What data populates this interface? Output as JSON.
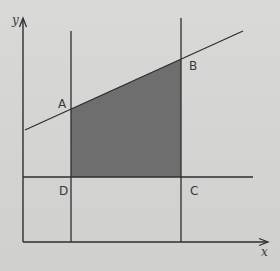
{
  "diagram": {
    "axes": {
      "x_label": "x",
      "y_label": "y"
    },
    "points": {
      "A": "A",
      "B": "B",
      "C": "C",
      "D": "D"
    },
    "shaded_region": "ABCD",
    "colors": {
      "background": "#d5d5d4",
      "lines": "#2e2e2e",
      "shaded": "#6e6e6e"
    }
  }
}
